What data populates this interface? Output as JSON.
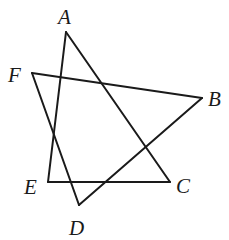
{
  "diagram": {
    "type": "geometry",
    "points": {
      "A": {
        "x": 66,
        "y": 32
      },
      "B": {
        "x": 202,
        "y": 98
      },
      "C": {
        "x": 170,
        "y": 182
      },
      "D": {
        "x": 79,
        "y": 205
      },
      "E": {
        "x": 48,
        "y": 182
      },
      "F": {
        "x": 32,
        "y": 73
      }
    },
    "labels": [
      {
        "id": "A",
        "text": "A",
        "x": 58,
        "y": 24
      },
      {
        "id": "B",
        "text": "B",
        "x": 208,
        "y": 106
      },
      {
        "id": "C",
        "text": "C",
        "x": 176,
        "y": 193
      },
      {
        "id": "D",
        "text": "D",
        "x": 69,
        "y": 235
      },
      {
        "id": "E",
        "text": "E",
        "x": 24,
        "y": 194
      },
      {
        "id": "F",
        "text": "F",
        "x": 8,
        "y": 82
      }
    ],
    "segments": [
      {
        "from": "A",
        "to": "E"
      },
      {
        "from": "A",
        "to": "C"
      },
      {
        "from": "E",
        "to": "C"
      },
      {
        "from": "F",
        "to": "D"
      },
      {
        "from": "F",
        "to": "B"
      },
      {
        "from": "B",
        "to": "D"
      }
    ],
    "line_color": "#1a1a1a"
  }
}
